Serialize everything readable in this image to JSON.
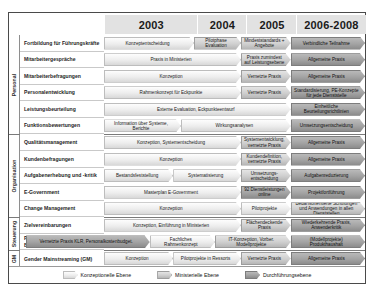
{
  "columns": [
    {
      "label": "2003"
    },
    {
      "label": "2004"
    },
    {
      "label": "2005"
    },
    {
      "label": "2006-2008"
    }
  ],
  "sections": [
    {
      "label": "Personal"
    },
    {
      "label": "Organisation"
    },
    {
      "label": "Steuerung"
    },
    {
      "label": "GM"
    }
  ],
  "rows": [
    {
      "label": "Fortbildung für Führungskräfte"
    },
    {
      "label": "Mitarbeitergespräche"
    },
    {
      "label": "Mitarbeiterbefragungen"
    },
    {
      "label": "Personalentwicklung"
    },
    {
      "label": "Leistungsbeurteilung"
    },
    {
      "label": "Funktionsbewertungen"
    },
    {
      "label": "Qualitätsmanagement"
    },
    {
      "label": "Kundenbefragungen"
    },
    {
      "label": "Aufgabenerhebung und -kritik"
    },
    {
      "label": "E-Government"
    },
    {
      "label": "Change Management"
    },
    {
      "label": "Zielvereinbarungen"
    },
    {
      "label": "Produkthaushalt, KLR, Budgetierung (EPOS.NRW)"
    },
    {
      "label": "Gender Mainstreaming (GM)"
    }
  ],
  "bars": [
    {
      "row": 0,
      "text": "Konzeptentscheidung",
      "level": "konz"
    },
    {
      "row": 0,
      "text": "Pilotphase Evaluation",
      "level": "min"
    },
    {
      "row": 0,
      "text": "Mindeststandards + Angebote",
      "level": "min"
    },
    {
      "row": 0,
      "text": "Verbindliche Teilnahme",
      "level": "durch"
    },
    {
      "row": 1,
      "text": "Praxis in Ministerien",
      "level": "konz"
    },
    {
      "row": 1,
      "text": "Praxis zumindest auf Leistungsebene",
      "level": "min"
    },
    {
      "row": 1,
      "text": "Allgemeine Praxis",
      "level": "durch"
    },
    {
      "row": 2,
      "text": "Konzeption",
      "level": "konz"
    },
    {
      "row": 2,
      "text": "Vernetzte Praxis",
      "level": "min"
    },
    {
      "row": 2,
      "text": "Allgemeine Praxis",
      "level": "durch"
    },
    {
      "row": 3,
      "text": "Rahmenkonzept für Eckpunkte",
      "level": "konz"
    },
    {
      "row": 3,
      "text": "Vernetzte Praxis",
      "level": "min"
    },
    {
      "row": 3,
      "text": "Standardisierung, PE-Konzepte für jede Dienststelle",
      "level": "durch"
    },
    {
      "row": 4,
      "text": "Externe Evaluation, Eckpunkteentwurf",
      "level": "konz"
    },
    {
      "row": 4,
      "text": "Einheitliche Beurteilungsrichtlinien",
      "level": "durch"
    },
    {
      "row": 5,
      "text": "Information über Systeme, Berichte",
      "level": "konz"
    },
    {
      "row": 5,
      "text": "Wirkungsanalysen",
      "level": "konz"
    },
    {
      "row": 5,
      "text": "Umsetzungsentscheidung",
      "level": "durch"
    },
    {
      "row": 6,
      "text": "Konzeption, Systementscheidung",
      "level": "konz"
    },
    {
      "row": 6,
      "text": "Systementwicklung, vernetzte Praxis",
      "level": "min"
    },
    {
      "row": 6,
      "text": "Allgemeine Praxis",
      "level": "durch"
    },
    {
      "row": 7,
      "text": "Konzeption",
      "level": "konz"
    },
    {
      "row": 7,
      "text": "Kundendefinition, vernetzte Praxis",
      "level": "min"
    },
    {
      "row": 7,
      "text": "Allgemeine Praxis",
      "level": "durch"
    },
    {
      "row": 8,
      "text": "Bestandsfeststellung",
      "level": "konz"
    },
    {
      "row": 8,
      "text": "Systematisierung",
      "level": "konz"
    },
    {
      "row": 8,
      "text": "Umsetzungs-entscheidung",
      "level": "min"
    },
    {
      "row": 8,
      "text": "Aufgabenreduzierung",
      "level": "durch"
    },
    {
      "row": 9,
      "text": "Masterplan E-Government",
      "level": "konz"
    },
    {
      "row": 9,
      "text": "92 Dienstleistungen online",
      "level": "durch"
    },
    {
      "row": 9,
      "text": "Projektfortführung",
      "level": "durch"
    },
    {
      "row": 10,
      "text": "Konzeption",
      "level": "konz"
    },
    {
      "row": 10,
      "text": "Pilotprojekte",
      "level": "konz"
    },
    {
      "row": 10,
      "text": "Bedarfsorientierte Schulungen und Anwendungen in allen Dienststellen",
      "level": "min"
    },
    {
      "row": 11,
      "text": "Konzeption, Einführung in Ministerien",
      "level": "konz"
    },
    {
      "row": 11,
      "text": "Flächendeckende Praxis",
      "level": "min"
    },
    {
      "row": 11,
      "text": "Wiederkehrende Praxis, Anwenderkritik",
      "level": "durch"
    },
    {
      "row": 12,
      "text": "Vernetzte Praxis KLR, Personalkostenbudget.",
      "level": "durch"
    },
    {
      "row": 12,
      "text": "Fachliches Rahmenkonzept",
      "level": "konz"
    },
    {
      "row": 12,
      "text": "IT-Konzeption, Vorber. Modellprojekte",
      "level": "min"
    },
    {
      "row": 12,
      "text": "(Modellprojekte) Produkthaushalt",
      "level": "durch"
    },
    {
      "row": 13,
      "text": "Konzeption",
      "level": "konz"
    },
    {
      "row": 13,
      "text": "Pilotprojekte in Ressorts",
      "level": "konz"
    },
    {
      "row": 13,
      "text": "Vernetzte Praxis",
      "level": "min"
    },
    {
      "row": 13,
      "text": "Allgemeine Praxis",
      "level": "durch"
    }
  ],
  "legend": [
    {
      "label": "Konzeptionelle Ebene",
      "level": "konz"
    },
    {
      "label": "Ministerielle Ebene",
      "level": "min"
    },
    {
      "label": "Durchführungsebene",
      "level": "durch"
    }
  ],
  "colors": {
    "konzeptionell": "#ededed",
    "ministeriell": "#cfcfcf",
    "durchfuehrung": "#a3a3a3",
    "header_bg": "#e2e2e2",
    "frame": "#4a4a4a"
  },
  "chart_data": {
    "type": "table",
    "title": "",
    "xlabel": "",
    "ylabel": "",
    "categories": [
      "2003",
      "2004",
      "2005",
      "2006-2008"
    ],
    "legend_position": "bottom",
    "grid": true
  }
}
